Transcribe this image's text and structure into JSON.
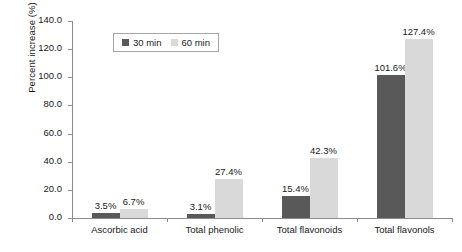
{
  "chart_data": {
    "type": "bar",
    "title": "",
    "xlabel": "",
    "ylabel": "Percent increase (%)",
    "ylim": [
      0,
      140
    ],
    "ytick_step": 20,
    "ytick_labels": [
      "0.0",
      "20.0",
      "40.0",
      "60.0",
      "80.0",
      "100.0",
      "120.0",
      "140.0"
    ],
    "grid": false,
    "legend_position": "top-left-inside",
    "categories": [
      "Ascorbic acid",
      "Total phenolic",
      "Total flavonoids",
      "Total flavonols"
    ],
    "series": [
      {
        "name": "30 min",
        "color": "#595959",
        "values": [
          3.5,
          3.1,
          15.4,
          101.6
        ],
        "labels": [
          "3.5%",
          "3.1%",
          "15.4%",
          "101.6%"
        ]
      },
      {
        "name": "60 min",
        "color": "#d9d9d9",
        "values": [
          6.7,
          27.4,
          42.3,
          127.4
        ],
        "labels": [
          "6.7%",
          "27.4%",
          "42.3%",
          "127.4%"
        ]
      }
    ]
  },
  "axis": {
    "line_color": "#8c8c8c"
  }
}
